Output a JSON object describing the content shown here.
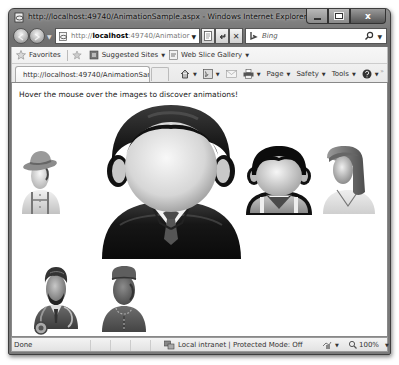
{
  "window": {
    "title": "http://localhost:49740/AnimationSample.aspx - Windows Internet Explorer",
    "controls": {
      "minimize": "minimize",
      "maximize": "maximize",
      "close": "x"
    }
  },
  "nav": {
    "address_prefix": "http://",
    "address_host": "localhost",
    "address_suffix": ":49740/Animatior",
    "search_placeholder": "Bing"
  },
  "favorites_bar": {
    "items": [
      {
        "label": "Favorites",
        "icon": "star-icon"
      },
      {
        "label": "Suggested Sites",
        "icon": "suggested-sites-icon",
        "dropdown": true
      },
      {
        "label": "Web Slice Gallery",
        "icon": "web-slice-icon",
        "dropdown": true
      }
    ]
  },
  "tabs": [
    {
      "label": "http://localhost:49740/AnimationSample.a...",
      "active": true
    }
  ],
  "command_bar": {
    "items": [
      {
        "name": "home",
        "icon": "home-icon",
        "label": ""
      },
      {
        "name": "feeds",
        "icon": "feeds-icon",
        "label": ""
      },
      {
        "name": "mail",
        "icon": "mail-icon",
        "label": ""
      },
      {
        "name": "print",
        "icon": "print-icon",
        "label": ""
      },
      {
        "name": "page",
        "label": "Page"
      },
      {
        "name": "safety",
        "label": "Safety"
      },
      {
        "name": "tools",
        "label": "Tools"
      },
      {
        "name": "help",
        "icon": "help-icon",
        "label": ""
      }
    ],
    "overflow": "»"
  },
  "content": {
    "instructions": "Hover the mouse over the images to discover animations!",
    "images": [
      {
        "name": "farmer-avatar",
        "description": "man with hat and suspenders"
      },
      {
        "name": "businessman-avatar",
        "description": "man in suit and tie (enlarged)"
      },
      {
        "name": "boy-avatar",
        "description": "boy in vest"
      },
      {
        "name": "woman-avatar",
        "description": "woman with long hair"
      },
      {
        "name": "doctor-avatar",
        "description": "doctor with stethoscope and beard"
      },
      {
        "name": "guard-avatar",
        "description": "man with cap and uniform"
      }
    ]
  },
  "status_bar": {
    "status": "Done",
    "zone": "Local intranet | Protected Mode: Off",
    "zoom": "100%"
  }
}
